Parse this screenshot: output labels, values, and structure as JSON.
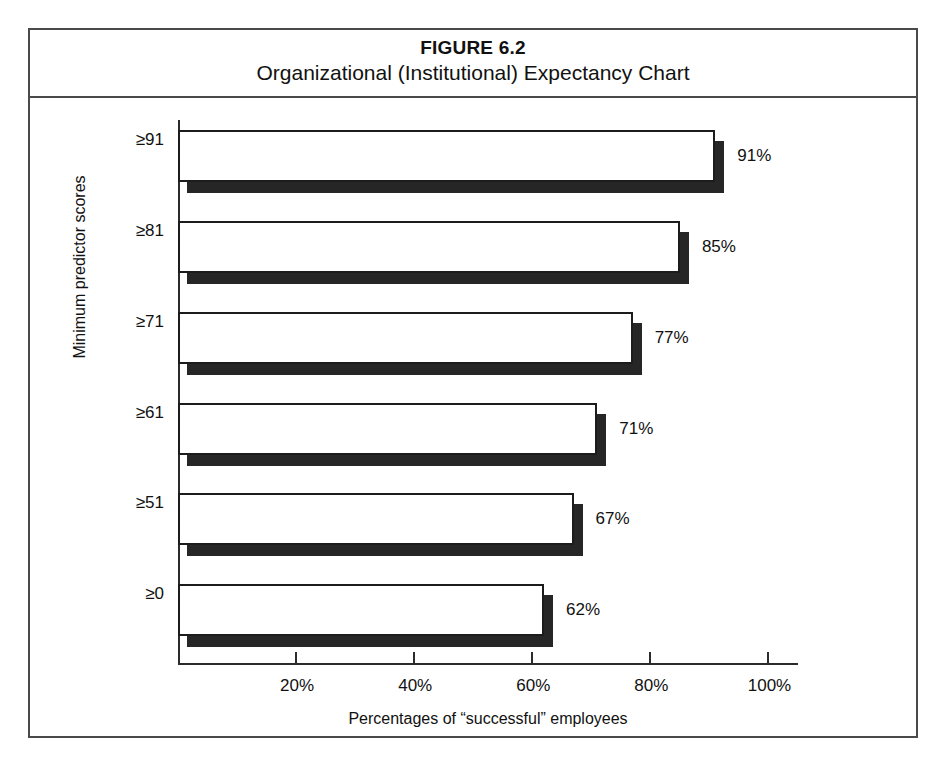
{
  "figure": {
    "number": "FIGURE 6.2",
    "title": "Organizational (Institutional) Expectancy Chart"
  },
  "chart_data": {
    "type": "bar",
    "orientation": "horizontal",
    "title": "Organizational (Institutional) Expectancy Chart",
    "subtitle": "FIGURE 6.2",
    "xlabel": "Percentages of “successful” employees",
    "ylabel": "Minimum predictor scores",
    "categories": [
      "≥91",
      "≥81",
      "≥71",
      "≥61",
      "≥51",
      "≥0"
    ],
    "values": [
      91,
      85,
      77,
      71,
      67,
      62
    ],
    "value_labels": [
      "91%",
      "85%",
      "77%",
      "71%",
      "67%",
      "62%"
    ],
    "xlim": [
      0,
      105
    ],
    "xticks": [
      20,
      40,
      60,
      80,
      100
    ],
    "xtick_labels": [
      "20%",
      "40%",
      "60%",
      "80%",
      "100%"
    ],
    "grid": false,
    "legend": null,
    "bar_style": {
      "face_color": "#ffffff",
      "edge_color": "#1c1c1c",
      "shadow_color": "#262626"
    }
  },
  "colors": {
    "frame": "#4a4a4a",
    "axis": "#2b2b2b",
    "text": "#111111"
  }
}
